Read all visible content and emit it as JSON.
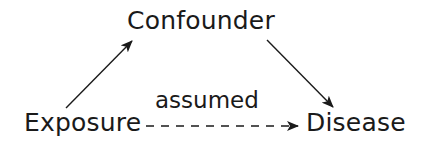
{
  "diagram": {
    "type": "causal-dag",
    "nodes": [
      {
        "id": "confounder",
        "label": "Confounder"
      },
      {
        "id": "exposure",
        "label": "Exposure"
      },
      {
        "id": "disease",
        "label": "Disease"
      }
    ],
    "edges": [
      {
        "from": "exposure",
        "to": "confounder",
        "style": "solid",
        "label": ""
      },
      {
        "from": "confounder",
        "to": "disease",
        "style": "solid",
        "label": ""
      },
      {
        "from": "exposure",
        "to": "disease",
        "style": "dashed",
        "label": "assumed"
      }
    ],
    "colors": {
      "ink": "#1a1a1a",
      "background": "#ffffff"
    }
  }
}
